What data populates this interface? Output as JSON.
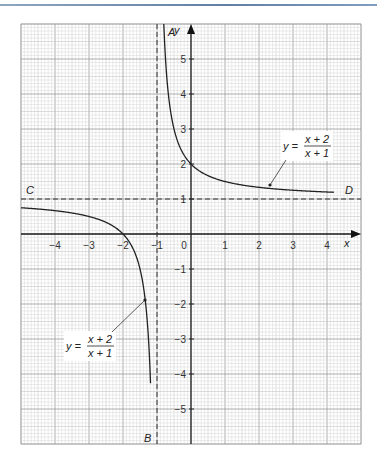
{
  "chart_data": {
    "type": "line",
    "title": "",
    "xlabel": "x",
    "ylabel": "y",
    "xlim": [
      -5,
      5
    ],
    "ylim": [
      -6,
      6
    ],
    "grid": true,
    "x_ticks": [
      -4,
      -3,
      -2,
      -1,
      0,
      1,
      2,
      3,
      4
    ],
    "y_ticks": [
      -5,
      -4,
      -3,
      -2,
      -1,
      1,
      2,
      3,
      4,
      5
    ],
    "x_tick_labels": [
      "−4",
      "−3",
      "−2",
      "−1",
      "0",
      "1",
      "2",
      "3",
      "4"
    ],
    "y_tick_labels": [
      "−5",
      "−4",
      "−3",
      "−2",
      "−1",
      "1",
      "2",
      "3",
      "4",
      "5"
    ],
    "function": "y = (x+2)/(x+1)",
    "series": [
      {
        "name": "right branch",
        "x_range": [
          -0.8,
          4.2
        ],
        "points": [
          [
            -0.8,
            6
          ],
          [
            -0.5,
            3
          ],
          [
            0,
            2
          ],
          [
            1,
            1.5
          ],
          [
            2,
            1.33
          ],
          [
            3,
            1.25
          ],
          [
            4.2,
            1.19
          ]
        ]
      },
      {
        "name": "left branch",
        "x_range": [
          -5,
          -1.19
        ],
        "points": [
          [
            -5,
            0.75
          ],
          [
            -4,
            0.67
          ],
          [
            -3,
            0.5
          ],
          [
            -2,
            0
          ],
          [
            -1.5,
            -1
          ],
          [
            -1.19,
            -4.3
          ]
        ]
      }
    ],
    "asymptotes": [
      {
        "type": "vertical",
        "x": -1,
        "labels": [
          "A",
          "B"
        ]
      },
      {
        "type": "horizontal",
        "y": 1,
        "labels": [
          "C",
          "D"
        ]
      }
    ],
    "annotations": [
      {
        "text": "y = (x+2)/(x+1)",
        "points_to": [
          1.5,
          1.4
        ]
      },
      {
        "text": "y = (x+2)/(x+1)",
        "points_to": [
          -1.25,
          -1.8
        ]
      }
    ]
  },
  "labels": {
    "x_axis": "x",
    "y_axis": "y",
    "A": "A",
    "B": "B",
    "C": "C",
    "D": "D",
    "origin": "0",
    "eq_y": "y =",
    "eq_num": "x + 2",
    "eq_den": "x + 1"
  }
}
